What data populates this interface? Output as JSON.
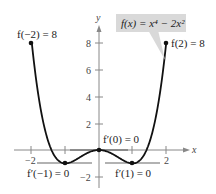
{
  "chart_data": {
    "type": "line",
    "title": "",
    "function_label": "f(x) = x⁴ − 2x²",
    "xlabel": "x",
    "ylabel": "y",
    "xlim": [
      -2.3,
      2.4
    ],
    "ylim": [
      -2.8,
      9.5
    ],
    "x_ticks": [
      -2,
      -1,
      1,
      2
    ],
    "x_tick_labels": [
      "−2",
      "",
      "",
      "2"
    ],
    "y_ticks": [
      -2,
      2,
      4,
      6,
      8
    ],
    "y_tick_labels": [
      "−2",
      "2",
      "4",
      "6",
      "8"
    ],
    "grid": false,
    "series": [
      {
        "name": "f(x) = x^4 - 2x^2",
        "x": [
          -2,
          -1.5,
          -1,
          -0.5,
          0,
          0.5,
          1,
          1.5,
          2
        ],
        "values": [
          8,
          0.5625,
          -1,
          -0.4375,
          0,
          -0.4375,
          -1,
          0.5625,
          8
        ]
      }
    ],
    "points": [
      {
        "x": -2,
        "y": 8,
        "label": "f(−2) = 8"
      },
      {
        "x": 2,
        "y": 8,
        "label": "f(2) = 8"
      },
      {
        "x": -1,
        "y": -1,
        "label": "f′(−1) = 0"
      },
      {
        "x": 0,
        "y": 0,
        "label": "f′(0) = 0"
      },
      {
        "x": 1,
        "y": -1,
        "label": "f′(1) = 0"
      }
    ],
    "annotations": [
      "f(−2) = 8",
      "f(2) = 8",
      "f′(−1) = 0",
      "f′(0) = 0",
      "f′(1) = 0"
    ]
  },
  "labels": {
    "function": "f(x) = x⁴ − 2x²",
    "f_neg2": "f(−2) = 8",
    "f_pos2": "f(2) = 8",
    "fp_neg1": "f′(−1) = 0",
    "fp_0": "f′(0) = 0",
    "fp_1": "f′(1) = 0",
    "x_axis": "x",
    "y_axis": "y",
    "tick_x_neg2": "−2",
    "tick_x_2": "2",
    "tick_y_8": "8",
    "tick_y_6": "6",
    "tick_y_4": "4",
    "tick_y_2": "2",
    "tick_y_neg2": "−2"
  }
}
